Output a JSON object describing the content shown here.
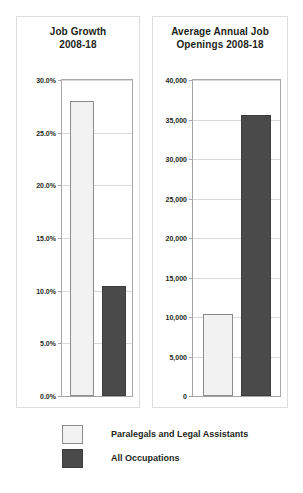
{
  "figure": {
    "background": "#ffffff",
    "colors": {
      "series_light": "#f2f2f2",
      "series_light_border": "#8c8c8c",
      "series_dark": "#4a4a4a",
      "series_dark_border": "#3d3d3d",
      "gridline": "#d9d9d9",
      "axis": "#a6a6a6",
      "panel_border": "#dddddd",
      "text": "#231f20"
    }
  },
  "legend": {
    "items": [
      {
        "label": "Paralegals and Legal Assistants",
        "swatch": "light"
      },
      {
        "label": "All Occupations",
        "swatch": "dark"
      }
    ]
  },
  "chart_data": [
    {
      "type": "bar",
      "title": "Job Growth 2008-18",
      "title_lines": [
        "Job Growth",
        "2008-18"
      ],
      "xlabel": "",
      "ylabel": "",
      "categories": [
        "Paralegals and Legal Assistants",
        "All Occupations"
      ],
      "values": [
        28.0,
        10.4
      ],
      "value_labels": [
        "28.0%",
        "10.4%"
      ],
      "ylim": [
        0,
        30
      ],
      "yticks": [
        0,
        5,
        10,
        15,
        20,
        25,
        30
      ],
      "ytick_labels": [
        "0.0%",
        "5.0%",
        "10.0%",
        "15.0%",
        "20.0%",
        "25.0%",
        "30.0%"
      ],
      "grid": true,
      "legend_position": "below-figure",
      "units": "percent"
    },
    {
      "type": "bar",
      "title": "Average Annual Job Openings 2008-18",
      "title_lines": [
        "Average Annual Job",
        "Openings 2008-18"
      ],
      "xlabel": "",
      "ylabel": "",
      "categories": [
        "Paralegals and Legal Assistants",
        "All Occupations"
      ],
      "values": [
        10400,
        35600
      ],
      "value_labels": [
        "10,400",
        "35,600"
      ],
      "ylim": [
        0,
        40000
      ],
      "yticks": [
        0,
        5000,
        10000,
        15000,
        20000,
        25000,
        30000,
        35000,
        40000
      ],
      "ytick_labels": [
        "0",
        "5,000",
        "10,000",
        "15,000",
        "20,000",
        "25,000",
        "30,000",
        "35,000",
        "40,000"
      ],
      "grid": true,
      "legend_position": "below-figure",
      "units": "openings"
    }
  ]
}
